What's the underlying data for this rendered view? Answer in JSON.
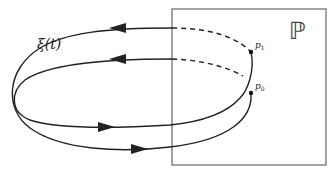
{
  "diagram": {
    "labels": {
      "trajectory": "ξ(t)",
      "section": "ℙ",
      "point_p1_base": "p",
      "point_p1_sub": "1",
      "point_p0_base": "p",
      "point_p0_sub": "0"
    },
    "colors": {
      "stroke": "#222222",
      "box": "#666666",
      "background": "#ffffff"
    },
    "elements": {
      "section_box": {
        "x": 172,
        "y": 9,
        "width": 154,
        "height": 156
      },
      "points": [
        {
          "name": "p1",
          "x": 251,
          "y": 52
        },
        {
          "name": "p0",
          "x": 251,
          "y": 93
        }
      ],
      "arrows": [
        {
          "direction": "left",
          "x": 120,
          "y": 28
        },
        {
          "direction": "left",
          "x": 120,
          "y": 59
        },
        {
          "direction": "right",
          "x": 105,
          "y": 127
        },
        {
          "direction": "right",
          "x": 138,
          "y": 149
        }
      ]
    }
  }
}
